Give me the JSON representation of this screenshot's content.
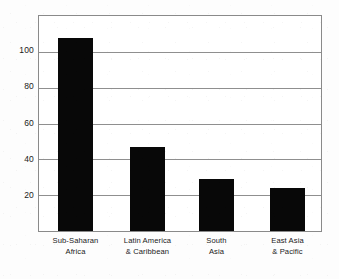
{
  "chart_data": {
    "type": "bar",
    "title": "",
    "subtitle": "",
    "xlabel": "",
    "ylabel": "",
    "categories": [
      "Sub-Saharan Africa",
      "Latin America & Caribbean",
      "South Asia",
      "East Asia & Pacific"
    ],
    "category_lines": [
      [
        "Sub-Saharan",
        "Africa"
      ],
      [
        "Latin America",
        "& Caribbean"
      ],
      [
        "South",
        "Asia"
      ],
      [
        "East Asia",
        "& Pacific"
      ]
    ],
    "values": [
      108,
      47,
      29,
      24
    ],
    "ylim": [
      0,
      120
    ],
    "yticks": [
      20,
      40,
      60,
      80,
      100
    ],
    "ytick_labels": [
      "20",
      "40",
      "60",
      "80",
      "100"
    ],
    "grid": true,
    "grid_axis": "y",
    "legend": "none",
    "bar_color": "#080808",
    "grid_color": "#8f8f8f",
    "frame_color": "#8a8a8a",
    "background_color": "#ffffff"
  },
  "geometry": {
    "plot": {
      "left": 38,
      "top": 15,
      "width": 284,
      "height": 217
    },
    "baseline_y": 232,
    "px_per_unit": 1.81,
    "bars": [
      {
        "left": 58,
        "width": 35
      },
      {
        "left": 130,
        "width": 35
      },
      {
        "left": 199,
        "width": 35
      },
      {
        "left": 270,
        "width": 35
      }
    ],
    "category_label_centers": [
      75.5,
      147.5,
      216.5,
      287.5
    ]
  }
}
